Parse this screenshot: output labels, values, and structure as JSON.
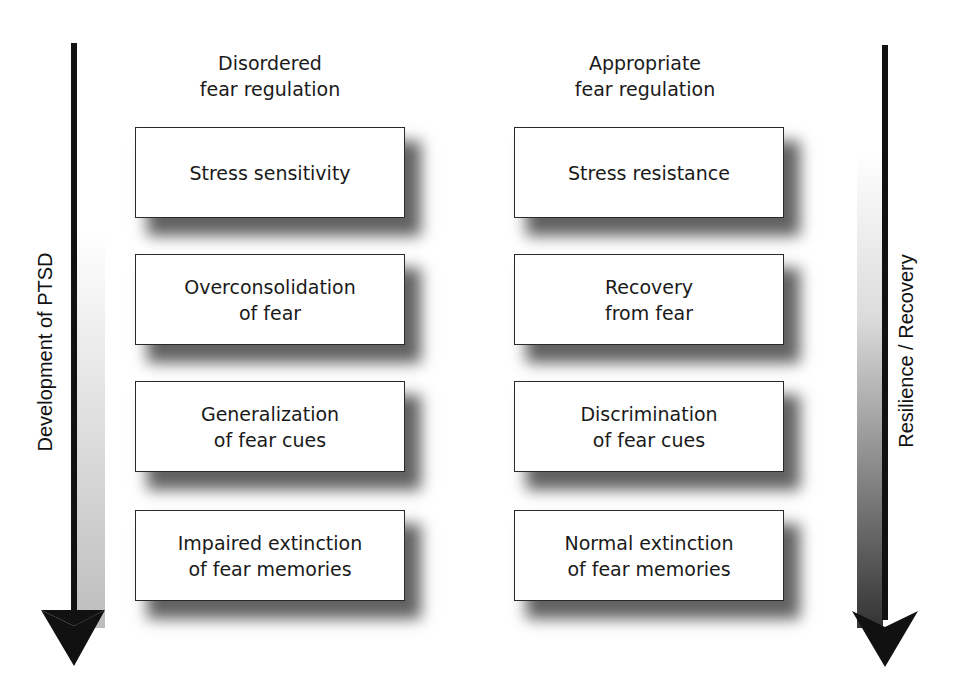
{
  "left_axis": {
    "label": "Development of PTSD",
    "arrow_direction": "down",
    "gradient": [
      "#ffffff",
      "#bdbdbd"
    ]
  },
  "right_axis": {
    "label": "Resilience / Recovery",
    "arrow_direction": "down",
    "gradient": [
      "#ffffff",
      "#333333"
    ]
  },
  "columns": [
    {
      "header": [
        "Disordered",
        "fear regulation"
      ],
      "boxes": [
        [
          "Stress sensitivity"
        ],
        [
          "Overconsolidation",
          "of fear"
        ],
        [
          "Generalization",
          "of fear cues"
        ],
        [
          "Impaired extinction",
          "of fear memories"
        ]
      ]
    },
    {
      "header": [
        "Appropriate",
        "fear regulation"
      ],
      "boxes": [
        [
          "Stress resistance"
        ],
        [
          "Recovery",
          "from fear"
        ],
        [
          "Discrimination",
          "of fear cues"
        ],
        [
          "Normal extinction",
          "of fear memories"
        ]
      ]
    }
  ]
}
